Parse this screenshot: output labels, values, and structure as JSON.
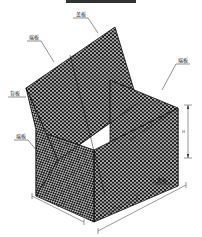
{
  "title_bar": {
    "color": "#333333"
  },
  "diagram": {
    "labels": {
      "lid": "盖板",
      "end_panel_top": "端板",
      "end_panel_right": "端板",
      "back_panel": "背板",
      "end_panel_lower": "端板",
      "face_panel": "面板"
    },
    "dimensions": {
      "height": "H",
      "width": "W",
      "length_partial": "1m",
      "length_total": "L"
    },
    "colors": {
      "mesh": "#1a1a1a",
      "background": "#ffffff",
      "line": "#222222"
    }
  }
}
